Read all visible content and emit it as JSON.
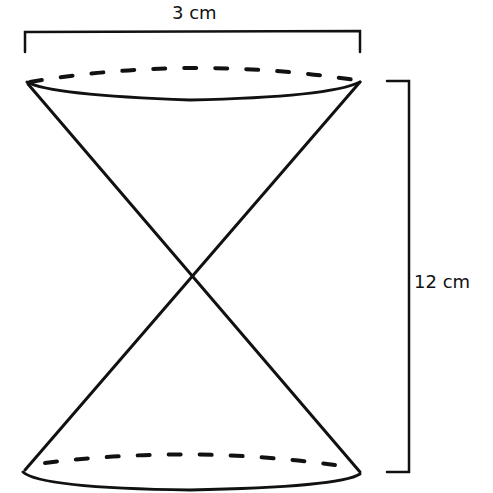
{
  "figure": {
    "type": "double cone (hourglass) diagram",
    "width_dimension": {
      "label": "3 cm"
    },
    "height_dimension": {
      "label": "12 cm"
    },
    "colors": {
      "stroke": "#111111",
      "background": "#ffffff"
    }
  }
}
